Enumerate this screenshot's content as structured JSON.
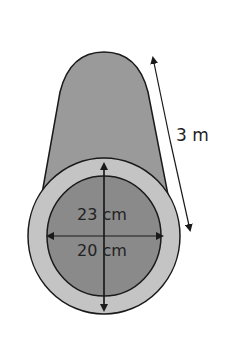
{
  "diagram": {
    "labels": {
      "length": "3 m",
      "outer_diameter": "23 cm",
      "inner_diameter": "20 cm"
    },
    "colors": {
      "body": "#9a9a9a",
      "outer_ring": "#c4c4c4",
      "inner_hole": "#8a8a8a",
      "stroke": "#1a1a1a",
      "background": "#ffffff"
    }
  }
}
